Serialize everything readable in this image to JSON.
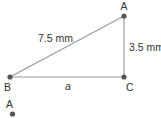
{
  "diagram": {
    "type": "right-triangle",
    "vertices": [
      {
        "id": "A",
        "label": "A"
      },
      {
        "id": "B",
        "label": "B"
      },
      {
        "id": "C",
        "label": "C"
      }
    ],
    "sides": {
      "hypotenuse_AB": "7.5 mm",
      "side_AC": "3.5 mm",
      "side_BC": "a"
    },
    "extra_point": {
      "label": "A"
    },
    "colors": {
      "line": "#9a9a9a",
      "point": "#555555",
      "text": "#333333"
    }
  }
}
